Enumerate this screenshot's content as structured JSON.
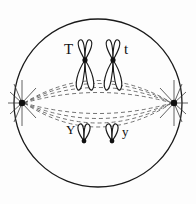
{
  "figure": {
    "background_color": "#fdfdfd",
    "stroke_color": "#1a1a1a",
    "spindle_color": "#555555"
  },
  "cell": {
    "name": "cell-membrane",
    "shape": "circle",
    "center_x": 98,
    "center_y": 103,
    "radius": 84,
    "stroke_color": "#1a1a1a",
    "stroke_width": 1.2,
    "fill": "none"
  },
  "poles": [
    {
      "name": "left-centrosome",
      "x": 22,
      "y": 103,
      "aster_ray_count": 9,
      "color": "#111111"
    },
    {
      "name": "right-centrosome",
      "x": 174,
      "y": 103,
      "aster_ray_count": 9,
      "color": "#111111"
    }
  ],
  "spindle": {
    "name": "spindle-apparatus",
    "style": "dashed",
    "dash_pattern": "4 3",
    "stroke_color": "#555555",
    "stroke_width": 0.9,
    "fiber_count": 8,
    "description": "Dashed spindle fibers arcing between the two poles, passing above and below the metaphase plate"
  },
  "chromosomes": [
    {
      "name": "chromosome-T",
      "allele": "T",
      "shape": "x-shaped",
      "size": "long",
      "center_x": 85,
      "centromere_y": 60,
      "label_side": "left",
      "description": "Long replicated chromosome, X-shaped, sister chromatids joined at centromere"
    },
    {
      "name": "chromosome-t",
      "allele": "t",
      "shape": "x-shaped",
      "size": "long",
      "center_x": 113,
      "centromere_y": 60,
      "label_side": "right",
      "description": "Homolog of chromosome T, X-shaped"
    },
    {
      "name": "chromosome-Y",
      "allele": "Y",
      "shape": "v-shaped",
      "size": "short",
      "center_x": 84,
      "centromere_y": 141,
      "label_side": "left",
      "description": "Short replicated chromosome, V-shaped, centromere at the bottom"
    },
    {
      "name": "chromosome-y",
      "allele": "y",
      "shape": "v-shaped",
      "size": "short",
      "center_x": 112,
      "centromere_y": 141,
      "label_side": "right",
      "description": "Homolog of chromosome Y, V-shaped"
    }
  ],
  "labels": {
    "T": "T",
    "t": "t",
    "Y": "Y",
    "y": "y"
  }
}
